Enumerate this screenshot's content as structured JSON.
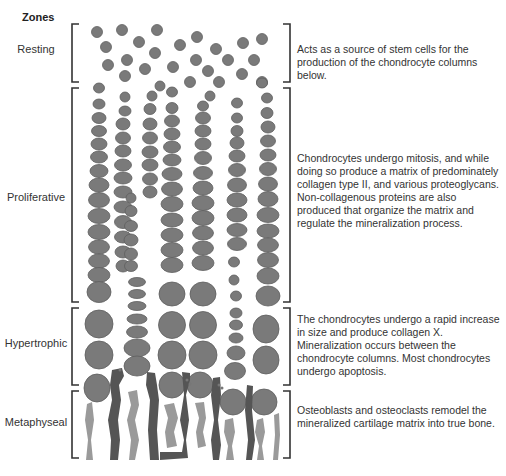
{
  "title": "Zones",
  "zones": [
    {
      "name": "Resting",
      "label_y": 50,
      "desc_y": 43,
      "bracket": [
        22,
        82
      ],
      "description": "Acts as a source of stem cells for the production of the chondrocyte columns below."
    },
    {
      "name": "Proliferative",
      "label_y": 191,
      "desc_y": 152,
      "bracket": [
        88,
        302
      ],
      "description": "Chondrocytes undergo mitosis, and while doing so produce a matrix of predominately collagen type II, and various proteoglycans. Non-collagenous proteins are also produced that organize the matrix and regulate the mineralization process."
    },
    {
      "name": "Hypertrophic",
      "label_y": 337,
      "desc_y": 313,
      "bracket": [
        308,
        385
      ],
      "description": "The chondrocytes undergo a rapid increase in size and produce collagen X. Mineralization occurs between the chondrocyte columns. Most chondrocytes undergo apoptosis."
    },
    {
      "name": "Metaphyseal",
      "label_y": 416,
      "desc_y": 404,
      "bracket": [
        391,
        458
      ],
      "description": "Osteoblasts and osteoclasts remodel the mineralized cartilage matrix into true bone."
    }
  ],
  "colors": {
    "cell": "#7a7a7a",
    "cell_edge": "#5e5e5e",
    "osteoclast": "#555555",
    "osteoblast": "#9a9a9a",
    "bracket": "#333333"
  }
}
